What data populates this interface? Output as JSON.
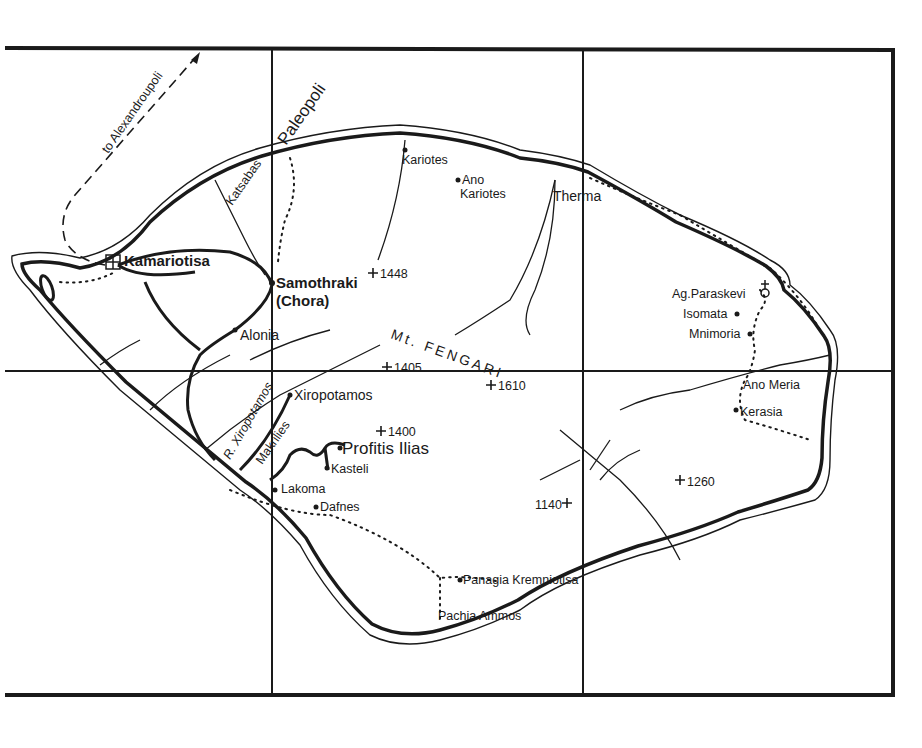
{
  "map": {
    "colors": {
      "ink": "#1a1a1a",
      "paper": "#ffffff"
    },
    "routes": {
      "ferry": "to Alexandroupoli"
    },
    "mountain": "Mt. FENGARI",
    "river": "R. Xiropotamos",
    "places": {
      "kamariotisa": "Kamariotisa",
      "samothraki": "Samothraki",
      "chora": "(Chora)",
      "alonia": "Alonia",
      "paleopoli": "Paleopoli",
      "katsabas": "Katsabas",
      "kariotes": "Kariotes",
      "ano": "Ano",
      "ano_kariotes": "Kariotes",
      "therma": "Therma",
      "ag_paraskevi": "Ag.Paraskevi",
      "isomata": "Isomata",
      "mnimoria": "Mnimoria",
      "ano_meria": "Ano Meria",
      "kerasia": "Kerasia",
      "xiropotamos": "Xiropotamos",
      "makrilies": "Makrilies",
      "profitis_ilias": "Profitis Ilias",
      "kasteli": "Kasteli",
      "lakoma": "Lakoma",
      "dafnes": "Dafnes",
      "panagia_kremniotisa": "Panagia Kremniotisa",
      "pachia_ammos": "Pachia Ammos"
    },
    "peaks": {
      "p1448": "1448",
      "p1405": "1405",
      "p1610": "1610",
      "p1400": "1400",
      "p1140": "1140",
      "p1260": "1260"
    }
  }
}
